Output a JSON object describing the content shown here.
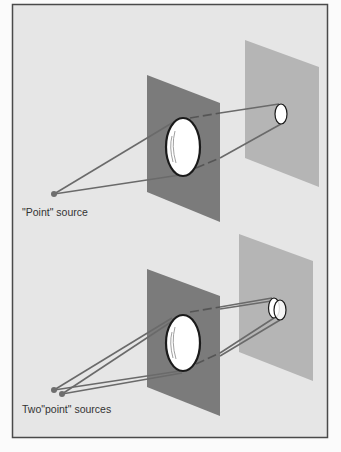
{
  "colors": {
    "page": "#fbfbfb",
    "frame_bg": "#e6e6e6",
    "frame_border": "#4a4a4a",
    "aperture_panel": "#7b7b7b",
    "screen_panel": "#b5b5b5",
    "ray": "#6a6a6a",
    "ray_hidden": "#555555",
    "source": "#6e6e6e",
    "lens_fill": "#ffffff",
    "lens_edge": "#1a1a1a"
  },
  "panels": [
    {
      "id": "top",
      "label": "\"Point\" source",
      "sources": 1
    },
    {
      "id": "bottom",
      "label": "Two\"point\" sources",
      "sources": 2
    }
  ]
}
